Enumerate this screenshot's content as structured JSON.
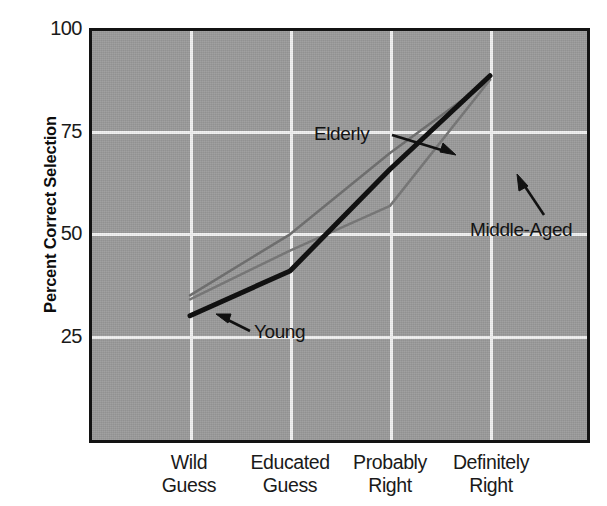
{
  "chart_data": {
    "type": "line",
    "title": "",
    "xlabel": "",
    "ylabel": "Percent Correct Selection",
    "categories": [
      "Wild Guess",
      "Educated Guess",
      "Probably Right",
      "Definitely Right"
    ],
    "category_lines": [
      [
        "Wild",
        "Guess"
      ],
      [
        "Educated",
        "Guess"
      ],
      [
        "Probably",
        "Right"
      ],
      [
        "Definitely",
        "Right"
      ]
    ],
    "ylim": [
      0,
      100
    ],
    "yticks": [
      25,
      50,
      75,
      100
    ],
    "ytick_labels": [
      "25",
      "50",
      "75",
      "100"
    ],
    "grid": true,
    "legend": "inline-annotations",
    "series": [
      {
        "name": "Young",
        "values": [
          30,
          41,
          66,
          89
        ],
        "color": "#111111",
        "width": 5
      },
      {
        "name": "Elderly",
        "values": [
          35,
          50,
          70,
          88
        ],
        "color": "#6e6e6e",
        "width": 2.5
      },
      {
        "name": "Middle-Aged",
        "values": [
          34,
          46,
          57,
          88
        ],
        "color": "#767676",
        "width": 2.5
      }
    ],
    "annotations": [
      {
        "label": "Elderly",
        "text_x": 222,
        "text_y": 92,
        "arrow_from_x": 300,
        "arrow_from_y": 104,
        "arrow_to_x": 360,
        "arrow_to_y": 122
      },
      {
        "label": "Middle-Aged",
        "text_x": 378,
        "text_y": 188,
        "arrow_from_x": 452,
        "arrow_from_y": 184,
        "arrow_to_x": 427,
        "arrow_to_y": 146
      },
      {
        "label": "Young",
        "text_x": 162,
        "text_y": 290,
        "arrow_from_x": 158,
        "arrow_from_y": 300,
        "arrow_to_x": 126,
        "arrow_to_y": 285
      }
    ],
    "plot_background_color": "#9b9b9b",
    "grid_color": "#f2f2f2",
    "frame_color": "#131313"
  }
}
